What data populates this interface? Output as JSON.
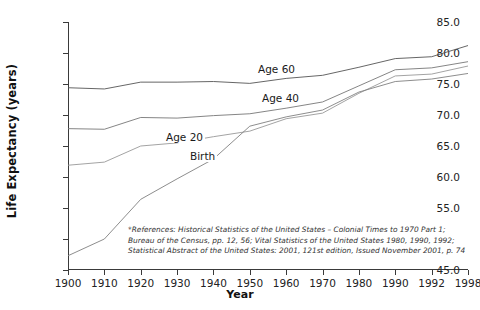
{
  "chart_data": {
    "type": "line",
    "title": "",
    "xlabel": "Year",
    "ylabel": "Life Expectancy (years)",
    "categories": [
      "1900",
      "1910",
      "1920",
      "1930",
      "1940",
      "1950",
      "1960",
      "1970",
      "1980",
      "1990",
      "1992",
      "1998"
    ],
    "xtick_labels": [
      "1900",
      "1910",
      "1920",
      "1930",
      "1940",
      "1950",
      "1960",
      "1970",
      "1980",
      "1990",
      "1992",
      "1998"
    ],
    "ytick_labels": [
      "45.0",
      "50.0",
      "55.0",
      "60.0",
      "65.0",
      "70.0",
      "75.0",
      "80.0",
      "85.0"
    ],
    "ytick_values": [
      45.0,
      50.0,
      55.0,
      60.0,
      65.0,
      70.0,
      75.0,
      80.0,
      85.0
    ],
    "ylim": [
      45.0,
      85.0
    ],
    "grid": false,
    "legend": "inline-labels",
    "series": [
      {
        "name": "Age 60",
        "label": "Age 60",
        "color": "#555555",
        "values": [
          74.4,
          74.2,
          75.3,
          75.3,
          75.4,
          75.1,
          75.9,
          76.4,
          77.7,
          79.1,
          79.4,
          81.2
        ]
      },
      {
        "name": "Age 40",
        "label": "Age 40",
        "color": "#777777",
        "values": [
          67.8,
          67.7,
          69.6,
          69.5,
          69.9,
          70.2,
          71.1,
          72.1,
          74.7,
          77.3,
          77.6,
          78.6
        ]
      },
      {
        "name": "Age 20",
        "label": "Age 20",
        "color": "#999999",
        "values": [
          61.9,
          62.4,
          65.0,
          65.5,
          66.5,
          67.4,
          69.4,
          70.3,
          73.5,
          76.3,
          76.6,
          77.9
        ]
      },
      {
        "name": "Birth",
        "label": "Birth",
        "color": "#808080",
        "values": [
          47.3,
          50.0,
          56.4,
          59.7,
          62.9,
          68.2,
          69.7,
          70.8,
          73.7,
          75.4,
          75.8,
          76.7
        ]
      }
    ],
    "series_label_positions": [
      {
        "name": "Age 60",
        "x_pct": 47.0,
        "y_value": 77.3
      },
      {
        "name": "Age 40",
        "x_pct": 48.0,
        "y_value": 72.6
      },
      {
        "name": "Age 20",
        "x_pct": 24.0,
        "y_value": 66.3
      },
      {
        "name": "Birth",
        "x_pct": 30.0,
        "y_value": 63.2
      }
    ],
    "footnote": [
      "*References: Historical Statistics of the United States – Colonial Times to 1970 Part 1;",
      "Bureau of the Census, pp. 12, 56; Vital Statistics of the United States 1980, 1990, 1992;",
      "Statistical Abstract of the United States: 2001, 121st edition, Issued November 2001, p. 74"
    ]
  }
}
